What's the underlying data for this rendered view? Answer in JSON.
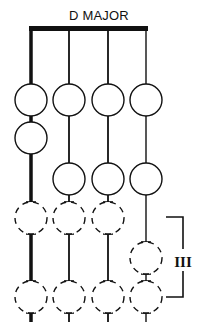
{
  "diagram": {
    "title": "D MAJOR",
    "position_label": "III",
    "strings": 4,
    "colors": {
      "ink": "#111111",
      "background": "#ffffff"
    },
    "fingering": [
      {
        "string": 1,
        "fret_row": 1,
        "style": "solid"
      },
      {
        "string": 1,
        "fret_row": 2,
        "style": "solid"
      },
      {
        "string": 1,
        "fret_row": 4,
        "style": "dashed"
      },
      {
        "string": 1,
        "fret_row": 6,
        "style": "dashed"
      },
      {
        "string": 2,
        "fret_row": 1,
        "style": "solid"
      },
      {
        "string": 2,
        "fret_row": 3,
        "style": "solid"
      },
      {
        "string": 2,
        "fret_row": 4,
        "style": "dashed"
      },
      {
        "string": 2,
        "fret_row": 6,
        "style": "dashed"
      },
      {
        "string": 3,
        "fret_row": 1,
        "style": "solid"
      },
      {
        "string": 3,
        "fret_row": 3,
        "style": "solid"
      },
      {
        "string": 3,
        "fret_row": 4,
        "style": "dashed"
      },
      {
        "string": 3,
        "fret_row": 6,
        "style": "dashed"
      },
      {
        "string": 4,
        "fret_row": 1,
        "style": "solid"
      },
      {
        "string": 4,
        "fret_row": 3,
        "style": "solid"
      },
      {
        "string": 4,
        "fret_row": 5,
        "style": "dashed"
      },
      {
        "string": 4,
        "fret_row": 6,
        "style": "dashed"
      }
    ]
  }
}
